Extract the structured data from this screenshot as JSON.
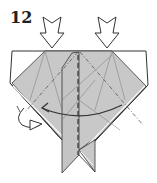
{
  "diagram": {
    "step_number": "12",
    "colors": {
      "paper_gray": "#c8c8c8",
      "paper_white": "#ffffff",
      "line": "#333333",
      "crease": "#666666"
    },
    "annotations": [
      {
        "type": "push-arrow",
        "position": "left"
      },
      {
        "type": "push-arrow",
        "position": "right"
      },
      {
        "type": "valley-fold-line",
        "orientation": "vertical",
        "position": "center"
      },
      {
        "type": "mountain-fold-line",
        "orientation": "diagonal",
        "position": "left"
      },
      {
        "type": "mountain-fold-line",
        "orientation": "diagonal",
        "position": "right"
      },
      {
        "type": "fold-arrow",
        "direction": "right-to-left"
      },
      {
        "type": "turn-over-arrow",
        "position": "bottom-left"
      }
    ]
  }
}
